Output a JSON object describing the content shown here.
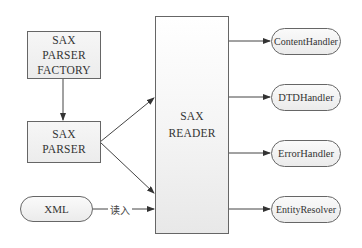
{
  "diagram": {
    "factory": {
      "lines": [
        "SAX",
        "PARSER",
        "FACTORY"
      ]
    },
    "parser": {
      "lines": [
        "SAX",
        "PARSER"
      ]
    },
    "reader": {
      "lines": [
        "SAX",
        "READER"
      ]
    },
    "input": {
      "label": "XML",
      "edge_label": "读入"
    },
    "handlers": [
      {
        "label": "ContentHandler"
      },
      {
        "label": "DTDHandler"
      },
      {
        "label": "ErrorHandler"
      },
      {
        "label": "EntityResolver"
      }
    ],
    "colors": {
      "stroke": "#555555",
      "fill": "#efefef",
      "text": "#333333"
    }
  }
}
